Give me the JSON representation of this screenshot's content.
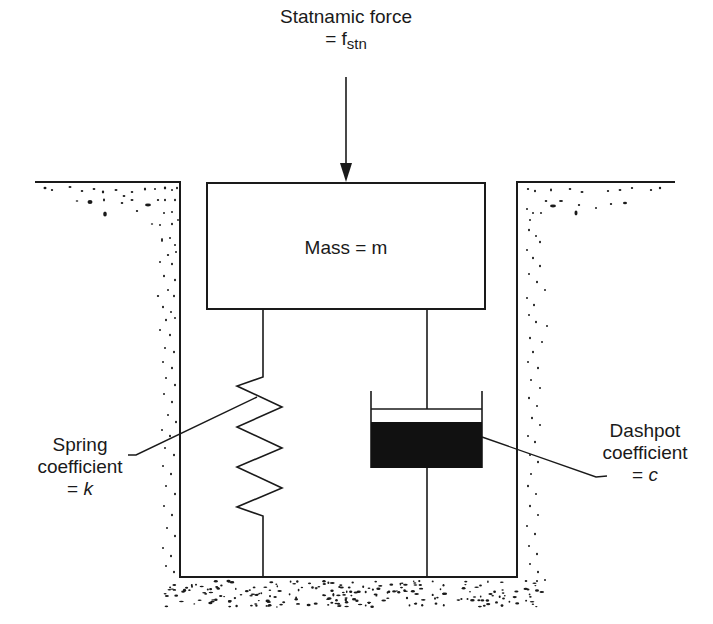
{
  "diagram": {
    "force": {
      "line1": "Statnamic force",
      "eq": "= f",
      "sub": "stn"
    },
    "mass": {
      "label": "Mass = m"
    },
    "spring": {
      "line1": "Spring",
      "line2": "coefficient",
      "eq": "= ",
      "symbol": "k"
    },
    "dashpot": {
      "line1": "Dashpot",
      "line2": "coefficient",
      "eq": "= ",
      "symbol": "c"
    },
    "colors": {
      "line": "#1a1a1a",
      "background": "#ffffff",
      "fluid": "#111111"
    }
  }
}
